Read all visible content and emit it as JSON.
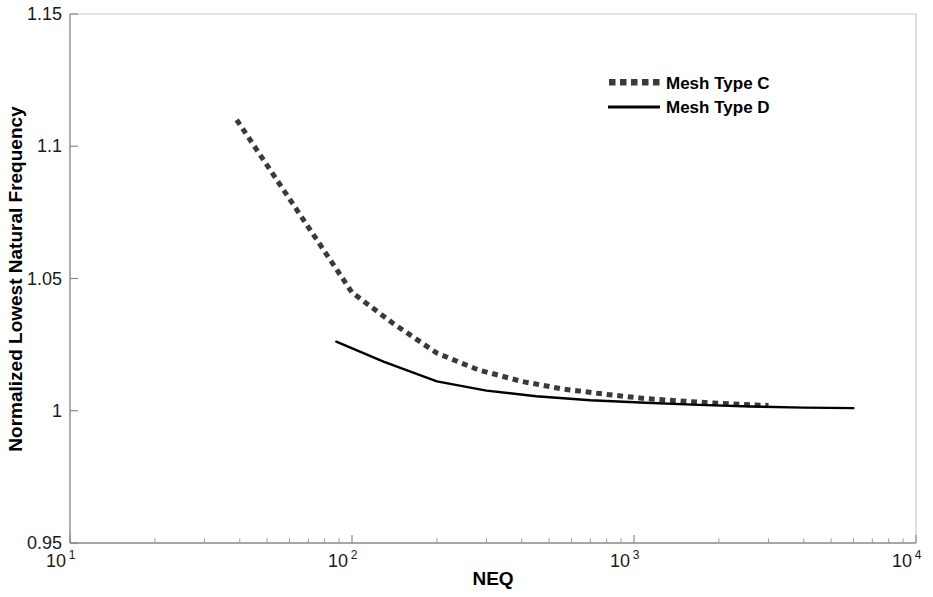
{
  "chart_data": {
    "type": "line",
    "title": "",
    "xlabel": "NEQ",
    "ylabel": "Normalized Lowest Natural Frequency",
    "xscale": "log",
    "yscale": "linear",
    "xlim": [
      10,
      10000
    ],
    "ylim": [
      0.95,
      1.15
    ],
    "grid": false,
    "legend_position": "top-right",
    "x_tick_labels": [
      "10",
      "10",
      "10",
      "10"
    ],
    "x_tick_exponents": [
      "1",
      "2",
      "3",
      "4"
    ],
    "x_tick_values": [
      10,
      100,
      1000,
      10000
    ],
    "y_tick_labels": [
      "1.15",
      "1.1",
      "1.05",
      "1",
      "0.95"
    ],
    "y_tick_values": [
      1.15,
      1.1,
      1.05,
      1.0,
      0.95
    ],
    "series": [
      {
        "name": "Mesh Type C",
        "style": "dotted",
        "color": "#3a3a3a",
        "width": 5,
        "x": [
          39,
          100,
          140,
          200,
          280,
          400,
          560,
          800,
          1100,
          1500,
          2000,
          2700,
          3000
        ],
        "y": [
          1.11,
          1.0447,
          1.033,
          1.0218,
          1.0155,
          1.0111,
          1.0082,
          1.0062,
          1.0046,
          1.0036,
          1.0028,
          1.0022,
          1.002
        ]
      },
      {
        "name": "Mesh Type D",
        "style": "solid",
        "color": "#000000",
        "width": 2.4,
        "x": [
          88,
          130,
          200,
          300,
          450,
          700,
          1100,
          1700,
          2600,
          4000,
          6000
        ],
        "y": [
          1.0261,
          1.0185,
          1.0111,
          1.0076,
          1.0055,
          1.004,
          1.003,
          1.0022,
          1.0016,
          1.0012,
          1.001
        ]
      }
    ]
  },
  "legend": {
    "entries": [
      {
        "label": "Mesh Type C"
      },
      {
        "label": "Mesh Type D"
      }
    ]
  },
  "axes": {
    "x_title": "NEQ",
    "y_title": "Normalized Lowest Natural Frequency"
  },
  "colors": {
    "axis": "#7a7a7a",
    "series_c": "#3a3a3a",
    "series_d": "#000000",
    "text": "#1a1a1a",
    "background": "#ffffff"
  }
}
